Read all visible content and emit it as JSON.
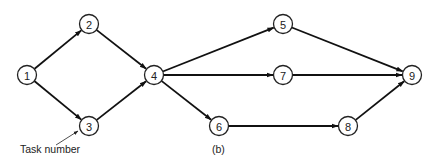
{
  "diagram": {
    "type": "network",
    "caption": "(b)",
    "annotation": {
      "text": "Task number",
      "points_to": "3"
    },
    "nodes": [
      {
        "id": "1",
        "label": "1",
        "x": 27,
        "y": 75
      },
      {
        "id": "2",
        "label": "2",
        "x": 89,
        "y": 24
      },
      {
        "id": "3",
        "label": "3",
        "x": 89,
        "y": 126
      },
      {
        "id": "4",
        "label": "4",
        "x": 154,
        "y": 75
      },
      {
        "id": "5",
        "label": "5",
        "x": 283,
        "y": 24
      },
      {
        "id": "6",
        "label": "6",
        "x": 219,
        "y": 126
      },
      {
        "id": "7",
        "label": "7",
        "x": 283,
        "y": 75
      },
      {
        "id": "8",
        "label": "8",
        "x": 348,
        "y": 126
      },
      {
        "id": "9",
        "label": "9",
        "x": 412,
        "y": 75
      }
    ],
    "edges": [
      {
        "from": "1",
        "to": "2"
      },
      {
        "from": "1",
        "to": "3"
      },
      {
        "from": "2",
        "to": "4"
      },
      {
        "from": "3",
        "to": "4"
      },
      {
        "from": "4",
        "to": "5"
      },
      {
        "from": "4",
        "to": "7"
      },
      {
        "from": "4",
        "to": "6"
      },
      {
        "from": "5",
        "to": "9"
      },
      {
        "from": "7",
        "to": "9"
      },
      {
        "from": "6",
        "to": "8"
      },
      {
        "from": "8",
        "to": "9"
      }
    ],
    "node_radius": 9.5,
    "colors": {
      "stroke": "#111111",
      "background": "#ffffff"
    }
  }
}
